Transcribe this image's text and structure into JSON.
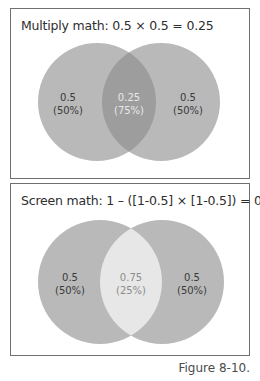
{
  "panels": [
    {
      "title": "Multiply math: 0.5 × 0.5 = 0.25",
      "left": {
        "value": "0.5",
        "pct": "(50%)"
      },
      "overlap": {
        "value": "0.25",
        "pct": "(75%)"
      },
      "right": {
        "value": "0.5",
        "pct": "(50%)"
      },
      "colors": {
        "circle": "#b9b9b9",
        "overlap": "#9d9d9d",
        "overlap_text": "#e8e8e8",
        "side_text": "#3a3a3a"
      }
    },
    {
      "title": "Screen math: 1 – ([1-0.5] × [1-0.5]) = 0.75",
      "left": {
        "value": "0.5",
        "pct": "(50%)"
      },
      "overlap": {
        "value": "0.75",
        "pct": "(25%)"
      },
      "right": {
        "value": "0.5",
        "pct": "(50%)"
      },
      "colors": {
        "circle": "#b9b9b9",
        "overlap": "#e7e7e7",
        "overlap_text": "#8c8c8c",
        "side_text": "#3a3a3a"
      }
    }
  ],
  "caption": "Figure 8-10."
}
